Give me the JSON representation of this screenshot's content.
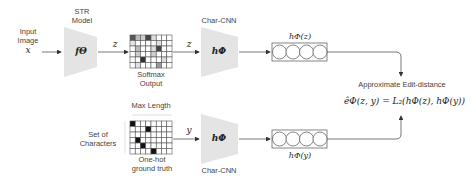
{
  "input": {
    "label_line1": "Input",
    "label_line2": "Image",
    "var": "x"
  },
  "str_model": {
    "title_line1": "STR",
    "title_line2": "Model",
    "func": "fΘ"
  },
  "edge_z1": "z",
  "softmax": {
    "label_line1": "Softmax",
    "label_line2": "Output",
    "rows": 6,
    "cols": 8,
    "shaded_cells": [
      {
        "r": 0,
        "c": 0,
        "shade": "#555"
      },
      {
        "r": 0,
        "c": 1,
        "shade": "#bbb"
      },
      {
        "r": 0,
        "c": 2,
        "shade": "#ccc"
      },
      {
        "r": 0,
        "c": 3,
        "shade": "#444"
      },
      {
        "r": 0,
        "c": 4,
        "shade": "#ddd"
      },
      {
        "r": 1,
        "c": 0,
        "shade": "#e5e5e5"
      },
      {
        "r": 1,
        "c": 5,
        "shade": "#e0e0e0"
      },
      {
        "r": 2,
        "c": 1,
        "shade": "#bbb"
      },
      {
        "r": 2,
        "c": 5,
        "shade": "#444"
      },
      {
        "r": 2,
        "c": 4,
        "shade": "#ddd"
      },
      {
        "r": 3,
        "c": 1,
        "shade": "#ccc"
      },
      {
        "r": 3,
        "c": 4,
        "shade": "#ccc"
      },
      {
        "r": 4,
        "c": 2,
        "shade": "#333"
      },
      {
        "r": 4,
        "c": 6,
        "shade": "#ddd"
      },
      {
        "r": 5,
        "c": 5,
        "shade": "#999"
      },
      {
        "r": 5,
        "c": 1,
        "shade": "#e0e0e0"
      }
    ]
  },
  "edge_z2": "z",
  "char_cnn_top": {
    "title": "Char-CNN",
    "func": "hΦ"
  },
  "embedding_top": {
    "label": "hΦ(z)",
    "circles": 4
  },
  "result": {
    "label": "Approximate Edit-distance",
    "formula": "êΦ(z, y) = L₂(hΦ(z), hΦ(y))"
  },
  "onehot": {
    "top_label": "Max Length",
    "side_label_line1": "Set of",
    "side_label_line2": "Characters",
    "bottom_label_line1": "One-hot",
    "bottom_label_line2": "ground truth",
    "rows": 6,
    "cols": 8,
    "filled_cells": [
      {
        "r": 0,
        "c": 0
      },
      {
        "r": 1,
        "c": 3
      },
      {
        "r": 3,
        "c": 1
      },
      {
        "r": 4,
        "c": 2
      },
      {
        "r": 5,
        "c": 4
      }
    ]
  },
  "edge_y": "y",
  "char_cnn_bottom": {
    "title": "Char-CNN",
    "func": "hΦ"
  },
  "embedding_bottom": {
    "label": "hΦ(y)",
    "circles": 4
  }
}
